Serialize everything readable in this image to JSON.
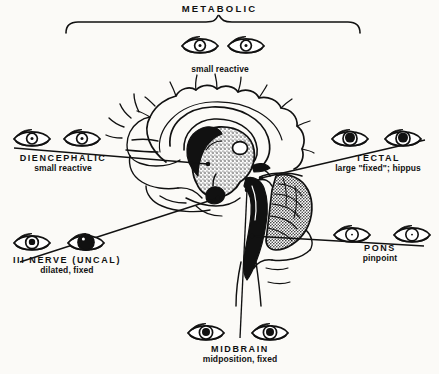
{
  "figure": {
    "title": "METABOLIC",
    "kind": "sagittal-brain-pupil-diagram"
  },
  "labels": {
    "metabolic": {
      "name": "METABOLIC",
      "desc": "small reactive"
    },
    "diencephalic": {
      "name": "DIENCEPHALIC",
      "desc": "small reactive"
    },
    "tectal": {
      "name": "TECTAL",
      "desc": "large \"fixed\"; hippus"
    },
    "third_nerve": {
      "name": "III NERVE (UNCAL)",
      "desc": "dilated, fixed"
    },
    "pons": {
      "name": "PONS",
      "desc": "pinpoint"
    },
    "midbrain": {
      "name": "MIDBRAIN",
      "desc": "midposition,  fixed"
    }
  },
  "colors": {
    "ink": "#111111",
    "paper": "#fbfaf7"
  },
  "icons": {
    "eye": "eye-icon",
    "brace": "brace-icon",
    "leader": "leader-line-icon"
  }
}
